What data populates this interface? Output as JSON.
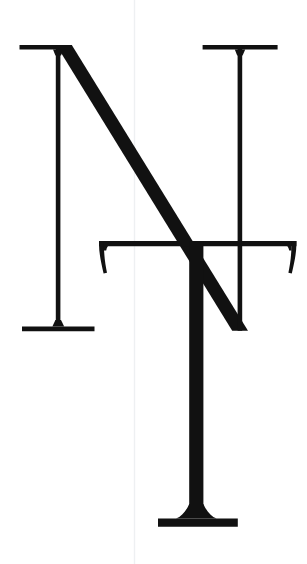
{
  "artwork": {
    "title": "NT monogram",
    "description": "Overlapping serif capital letters N and T",
    "alt_text": "A black serif capital N with a larger serif capital T superimposed over it on a white background",
    "background_color": "#ffffff",
    "ink_color": "#111111",
    "guide_color": "#eef0f2",
    "canvas_width": 307,
    "canvas_height": 564,
    "letters": [
      {
        "character": "N",
        "role": "background-letter",
        "color": "#111111",
        "bbox": [
          19,
          45,
          296,
          331
        ]
      },
      {
        "character": "T",
        "role": "foreground-letter",
        "color": "#111111",
        "bbox": [
          99,
          241,
          296,
          527
        ]
      }
    ],
    "guide": {
      "name": "vertical-guideline",
      "x": 134,
      "y_start": 0,
      "y_end": 564,
      "color": "#eef0f2",
      "width": 1
    }
  }
}
